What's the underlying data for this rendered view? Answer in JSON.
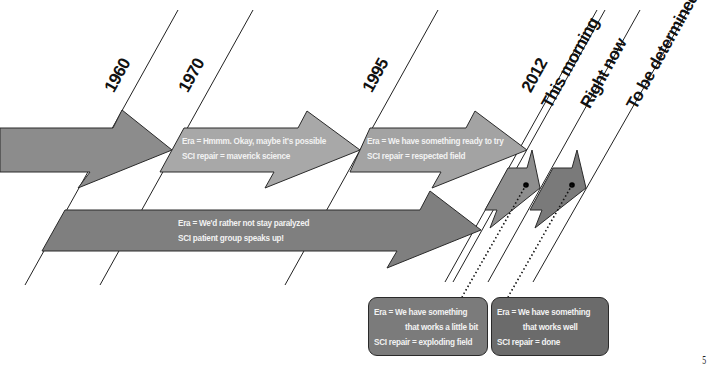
{
  "timeline": {
    "markers": [
      {
        "label": "1960"
      },
      {
        "label": "1970"
      },
      {
        "label": "1995"
      },
      {
        "label": "2012"
      },
      {
        "label": "This morning"
      },
      {
        "label": "Right now"
      },
      {
        "label": "To be determined"
      }
    ],
    "arrows": [
      {
        "era": "",
        "detail": ""
      },
      {
        "era": "Era = Hmmm. Okay, maybe it's possible",
        "detail": "SCI repair = maverick science"
      },
      {
        "era": "Era = We have something ready to try",
        "detail": "SCI repair = respected field"
      },
      {
        "era": "Era = We'd rather not stay paralyzed",
        "detail": "SCI patient group speaks up!"
      }
    ],
    "callouts": [
      {
        "line1": "Era = We have something",
        "line2": "that works a little bit",
        "line3": "SCI repair = exploding field"
      },
      {
        "line1": "Era = We have something",
        "line2": "that works well",
        "line3": "SCI repair = done"
      }
    ]
  },
  "colors": {
    "arrow_1960": "#8c8c8c",
    "arrow_1970": "#a8a8a8",
    "arrow_1995": "#a3a3a3",
    "arrow_patient": "#7f7f7f",
    "arrow_small_1": "#8e8e8e",
    "arrow_small_2": "#7a7a7a",
    "callout_1": "#7b7b7b",
    "callout_2": "#6b6b6b"
  },
  "page_number": "5"
}
